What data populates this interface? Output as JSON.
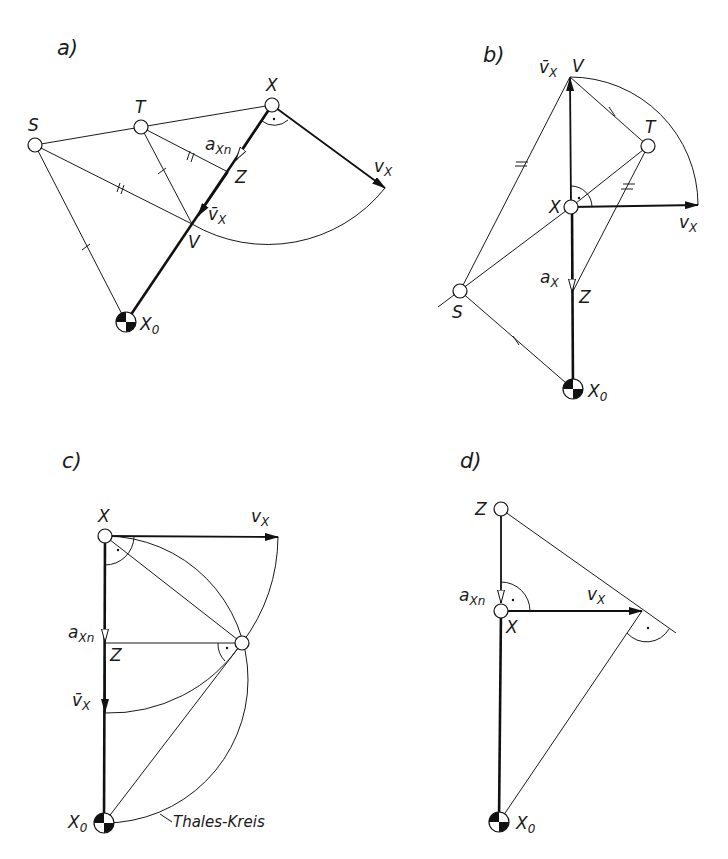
{
  "panels": {
    "a": {
      "label": "a)",
      "points": {
        "S": "S",
        "T": "T",
        "X": "X",
        "Z": "Z",
        "V": "V",
        "X0": "X",
        "X0_sub": "0"
      },
      "vectors": {
        "vx": "v",
        "vx_sub": "X",
        "vbar": "v̄",
        "vbar_sub": "X",
        "axn": "a",
        "axn_sub": "Xn"
      }
    },
    "b": {
      "label": "b)",
      "points": {
        "S": "S",
        "T": "T",
        "X": "X",
        "Z": "Z",
        "V": "V",
        "X0": "X",
        "X0_sub": "0"
      },
      "vectors": {
        "vx": "v",
        "vx_sub": "X",
        "vbar": "v̄",
        "vbar_sub": "X",
        "ax": "a",
        "ax_sub": "X"
      }
    },
    "c": {
      "label": "c)",
      "points": {
        "X": "X",
        "Z": "Z",
        "X0": "X",
        "X0_sub": "0"
      },
      "vectors": {
        "vx": "v",
        "vx_sub": "X",
        "vbar": "v̄",
        "vbar_sub": "X",
        "axn": "a",
        "axn_sub": "Xn"
      },
      "annotation": "Thales-Kreis"
    },
    "d": {
      "label": "d)",
      "points": {
        "Z": "Z",
        "X": "X",
        "X0": "X",
        "X0_sub": "0"
      },
      "vectors": {
        "vx": "v",
        "vx_sub": "X",
        "axn": "a",
        "axn_sub": "Xn"
      }
    }
  }
}
